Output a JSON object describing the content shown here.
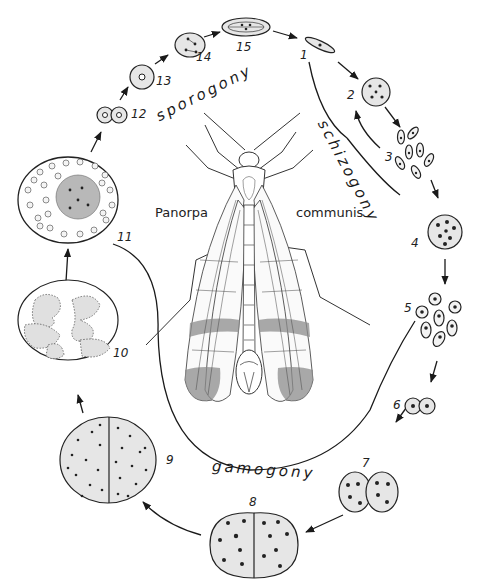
{
  "figure": {
    "species": {
      "genus": "Panorpa",
      "epithet": "communis"
    },
    "phases": {
      "sporogony": "sporogony",
      "schizogony": "schizogony",
      "gamogony": "gamogony"
    },
    "stages": [
      {
        "n": "1",
        "desc": "spindle-shaped sporozoite"
      },
      {
        "n": "2",
        "desc": "schizont with several nuclei"
      },
      {
        "n": "3",
        "desc": "merozoites"
      },
      {
        "n": "4",
        "desc": "schizont with many nuclei"
      },
      {
        "n": "5",
        "desc": "merozoites"
      },
      {
        "n": "6",
        "desc": "paired gamonts"
      },
      {
        "n": "7",
        "desc": "associated gamonts with dividing nuclei"
      },
      {
        "n": "8",
        "desc": "gamontocyst with multiple nuclei"
      },
      {
        "n": "9",
        "desc": "gamontocyst with many nuclei"
      },
      {
        "n": "10",
        "desc": "gamete formation"
      },
      {
        "n": "11",
        "desc": "oocyst with zygotes and residual body"
      },
      {
        "n": "12",
        "desc": "zygote pair"
      },
      {
        "n": "13",
        "desc": "sporoblast"
      },
      {
        "n": "14",
        "desc": "sporocyst with dividing nuclei"
      },
      {
        "n": "15",
        "desc": "spore with sporozoites"
      }
    ],
    "colors": {
      "ink": "#1a1a1a",
      "cell_fill": "#e6e6e6",
      "background": "#ffffff",
      "wing_band": "#8c8c8c"
    }
  }
}
